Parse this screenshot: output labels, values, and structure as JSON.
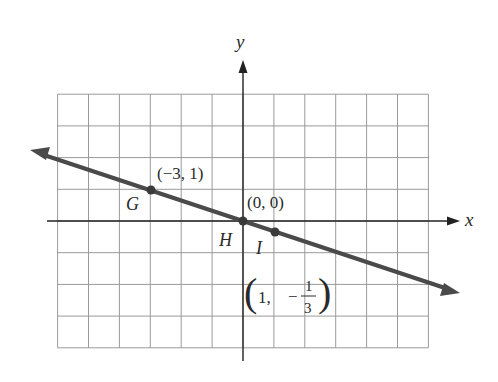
{
  "chart_data": {
    "type": "line",
    "title": "",
    "xlabel": "x",
    "ylabel": "y",
    "xlim": [
      -6,
      6
    ],
    "ylim": [
      -4,
      4
    ],
    "grid": true,
    "grid_step": 1,
    "series": [
      {
        "name": "line through origin",
        "slope": -0.3333,
        "intercept": 0,
        "points": [
          {
            "label": "G",
            "x": -3,
            "y": 1,
            "coord_text": "(−3, 1)"
          },
          {
            "label": "H",
            "x": 0,
            "y": 0,
            "coord_text": "(0, 0)"
          },
          {
            "label": "I",
            "x": 1,
            "y": -0.3333,
            "coord_text": "(1, −1/3)"
          }
        ]
      }
    ],
    "annotations": {
      "G_coord": "(−3, 1)",
      "H_coord": "(0, 0)",
      "I_coord_prefix": "1,",
      "I_coord_minus": "−",
      "I_coord_num": "1",
      "I_coord_den": "3"
    },
    "point_labels": {
      "G": "G",
      "H": "H",
      "I": "I"
    },
    "colors": {
      "line": "#4a4a4a",
      "grid": "#9a9a9a",
      "axis": "#222222",
      "point": "#3a3a3a"
    }
  }
}
